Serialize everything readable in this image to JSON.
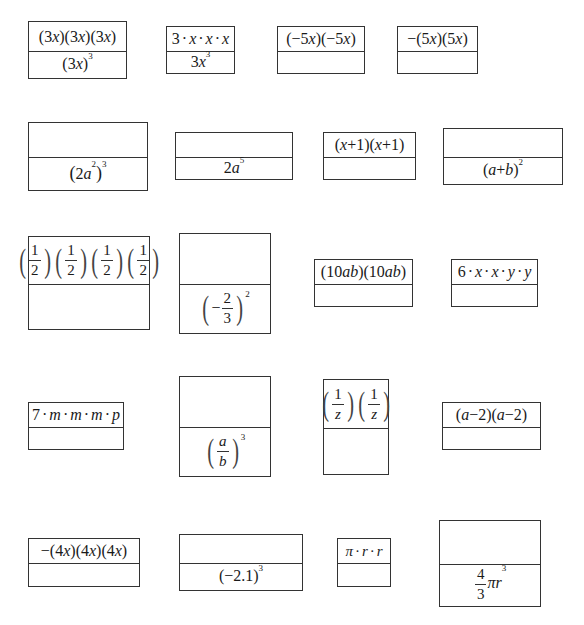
{
  "worksheet": {
    "cards": [
      {
        "id": "c1",
        "top": "(3x)(3x)(3x)",
        "bottom": "(3x)^3"
      },
      {
        "id": "c2",
        "top": "3·x·x·x",
        "bottom": "3x^3"
      },
      {
        "id": "c3",
        "top": "(−5x)(−5x)",
        "bottom": ""
      },
      {
        "id": "c4",
        "top": "−(5x)(5x)",
        "bottom": ""
      },
      {
        "id": "c5",
        "top": "",
        "bottom": "(2a^2)^3"
      },
      {
        "id": "c6",
        "top": "",
        "bottom": "2a^5"
      },
      {
        "id": "c7",
        "top": "(x+1)(x+1)",
        "bottom": ""
      },
      {
        "id": "c8",
        "top": "",
        "bottom": "(a+b)^2"
      },
      {
        "id": "c9",
        "top": "(1/2)(1/2)(1/2)(1/2)",
        "bottom": ""
      },
      {
        "id": "c10",
        "top": "",
        "bottom": "(−2/3)^2"
      },
      {
        "id": "c11",
        "top": "(10ab)(10ab)",
        "bottom": ""
      },
      {
        "id": "c12",
        "top": "6·x·x·y·y",
        "bottom": ""
      },
      {
        "id": "c13",
        "top": "7·m·m·m·p",
        "bottom": ""
      },
      {
        "id": "c14",
        "top": "",
        "bottom": "(a/b)^3"
      },
      {
        "id": "c15",
        "top": "(1/z)(1/z)",
        "bottom": ""
      },
      {
        "id": "c16",
        "top": "(a−2)(a−2)",
        "bottom": ""
      },
      {
        "id": "c17",
        "top": "−(4x)(4x)(4x)",
        "bottom": ""
      },
      {
        "id": "c18",
        "top": "",
        "bottom": "(−2.1)^3"
      },
      {
        "id": "c19",
        "top": "π·r·r",
        "bottom": ""
      },
      {
        "id": "c20",
        "top": "",
        "bottom": "(4/3)πr^3"
      }
    ],
    "parts": {
      "c1": {
        "t": "3",
        "x": "x",
        "exp": "3"
      },
      "c2": {
        "n": "3",
        "x": "x",
        "exp": "3"
      },
      "c3": {
        "a": "−5",
        "x": "x"
      },
      "c4": {
        "neg": "−",
        "a": "5",
        "x": "x"
      },
      "c5": {
        "a": "2",
        "v": "a",
        "e1": "2",
        "e2": "3"
      },
      "c6": {
        "a": "2",
        "v": "a",
        "exp": "5"
      },
      "c7": {
        "x": "x",
        "plus": "+1"
      },
      "c8": {
        "a": "a",
        "op": "+",
        "b": "b",
        "exp": "2"
      },
      "c9": {
        "num": "1",
        "den": "2"
      },
      "c10": {
        "neg": "−",
        "num": "2",
        "den": "3",
        "exp": "2"
      },
      "c11": {
        "n": "10",
        "v": "ab"
      },
      "c12": {
        "n": "6",
        "x": "x",
        "y": "y"
      },
      "c13": {
        "n": "7",
        "m": "m",
        "p": "p"
      },
      "c14": {
        "num": "a",
        "den": "b",
        "exp": "3"
      },
      "c15": {
        "num": "1",
        "den": "z"
      },
      "c16": {
        "a": "a",
        "rest": "−2"
      },
      "c17": {
        "neg": "−",
        "n": "4",
        "x": "x"
      },
      "c18": {
        "base": "−2.1",
        "exp": "3"
      },
      "c19": {
        "pi": "π",
        "r": "r"
      },
      "c20": {
        "num": "4",
        "den": "3",
        "pi": "π",
        "r": "r",
        "exp": "3"
      }
    }
  }
}
